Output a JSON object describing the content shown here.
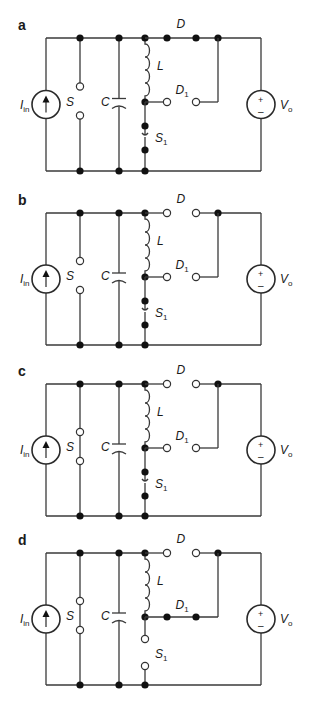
{
  "figure": {
    "colors": {
      "wire": "#3a3a3a",
      "node": "#111111",
      "background": "#ffffff"
    },
    "layout": {
      "x_left": 46,
      "x_S": 80,
      "x_C": 119,
      "x_L": 145,
      "x_D_a": 167,
      "x_D_b": 196,
      "x_join": 218,
      "x_right": 261,
      "panel_label_x": 18
    },
    "labels": {
      "current_source": "I",
      "current_source_sub": "in",
      "switch_S": "S",
      "capacitor": "C",
      "inductor": "L",
      "diode_D": "D",
      "diode_D1": "D",
      "diode_D1_sub": "1",
      "switch_S1": "S",
      "switch_S1_sub": "1",
      "voltage_source": "V",
      "voltage_source_sub": "o",
      "plus": "+",
      "minus": "–"
    },
    "panels": [
      {
        "id": "a",
        "label": "a",
        "top": 38,
        "bottom": 171,
        "S_closed": false,
        "D_conducting": true,
        "D1_conducting": false,
        "S1_closed": true
      },
      {
        "id": "b",
        "label": "b",
        "top": 213,
        "bottom": 345,
        "S_closed": false,
        "D_conducting": false,
        "D1_conducting": false,
        "S1_closed": true
      },
      {
        "id": "c",
        "label": "c",
        "top": 384,
        "bottom": 516,
        "S_closed": true,
        "D_conducting": false,
        "D1_conducting": false,
        "S1_closed": true
      },
      {
        "id": "d",
        "label": "d",
        "top": 553,
        "bottom": 685,
        "S_closed": true,
        "D_conducting": false,
        "D1_conducting": true,
        "S1_closed": false
      }
    ]
  }
}
